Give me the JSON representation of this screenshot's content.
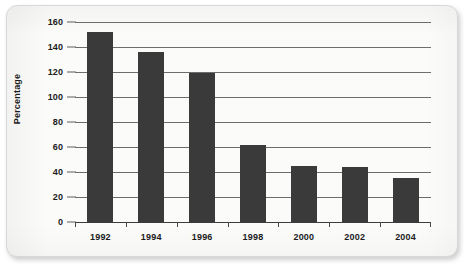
{
  "chart_data": {
    "type": "bar",
    "title": "",
    "xlabel": "",
    "ylabel": "Percentage",
    "categories": [
      "1992",
      "1994",
      "1996",
      "1998",
      "2000",
      "2002",
      "2004"
    ],
    "values": [
      152,
      136,
      119,
      62,
      45,
      44,
      35
    ],
    "series": [
      {
        "name": "Percentage",
        "values": [
          152,
          136,
          119,
          62,
          45,
          44,
          35
        ]
      }
    ],
    "ylim": [
      0,
      160
    ],
    "ytick_values": [
      0,
      20,
      40,
      60,
      80,
      100,
      120,
      140,
      160
    ],
    "ytick_labels": [
      "0",
      "20",
      "40",
      "60",
      "80",
      "100",
      "120",
      "140",
      "160"
    ],
    "grid": true,
    "grid_axis": "y",
    "legend": false,
    "legend_position": "none",
    "bar_color": "#3a3a3a",
    "gridline_color": "#6d6d6d",
    "axis_color": "#3d3d3d",
    "background_color": "#fbfbfa"
  }
}
